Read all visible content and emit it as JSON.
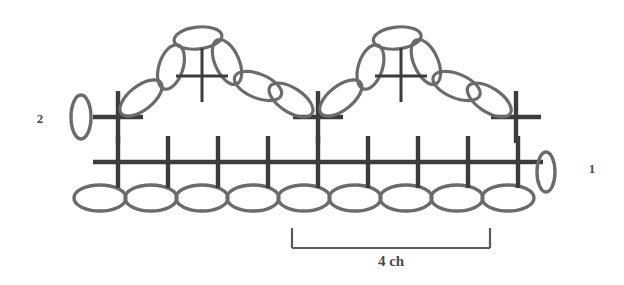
{
  "diagram": {
    "background_color": "#ffffff",
    "stitch_color": "#3c3c3c",
    "chain_color": "#6b6b6b",
    "bracket_color": "#5a5a5a",
    "label_color": "#4a4a4a",
    "row_labels": [
      {
        "name": "row-2-label",
        "text": "2",
        "x": 40,
        "y": 123
      },
      {
        "name": "row-1-label",
        "text": "1",
        "x": 592,
        "y": 173
      }
    ],
    "measure": {
      "text": "4 ch",
      "x_start": 292,
      "x_end": 490,
      "y_top": 228,
      "y_bottom": 248,
      "label_x": 391,
      "label_y": 266
    },
    "foundation_chain": {
      "name": "foundation-chain",
      "count": 9,
      "y": 198,
      "x_start": 100,
      "spacing": 51,
      "rx": 26,
      "ry": 13
    },
    "row1": {
      "name": "row-1-single-crochet",
      "count": 9,
      "y": 162,
      "x_start": 118,
      "spacing": 50,
      "arm": 21,
      "stem": 26,
      "turning_chain": {
        "cx": 546,
        "cy": 172,
        "rx": 9,
        "ry": 20
      }
    },
    "row2": {
      "name": "row-2-single-crochet",
      "y": 117,
      "positions": [
        118,
        318,
        516
      ],
      "arm": 21,
      "stem": 26,
      "turning_chain": {
        "cx": 81,
        "cy": 117,
        "rx": 10,
        "ry": 22
      }
    },
    "motifs": [
      {
        "name": "chain-arch-motif-left",
        "x_left": 118,
        "x_right": 318,
        "apex_y": 30,
        "base_y": 112,
        "center_cross_x": 202,
        "center_cross_y": 76
      },
      {
        "name": "chain-arch-motif-right",
        "x_left": 318,
        "x_right": 516,
        "apex_y": 30,
        "base_y": 112,
        "center_cross_x": 401,
        "center_cross_y": 76
      }
    ],
    "legend_notes": {
      "cross_symbol": "single crochet (sc)",
      "oval_symbol": "chain (ch)"
    }
  }
}
